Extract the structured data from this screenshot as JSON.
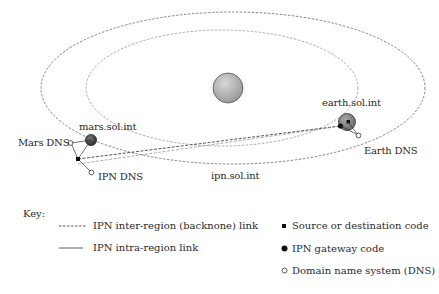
{
  "diagram": {
    "labels": {
      "mars_node": "mars.sol.int",
      "earth_node": "earth.sol.int",
      "mars_dns": "Mars DNS",
      "ipn_dns": "IPN DNS",
      "earth_dns": "Earth DNS",
      "ipn_region": "ipn.sol.int"
    },
    "colors": {
      "orbit_line": "#6a6a6a",
      "sun_fill": "#b5b5b5",
      "planet_fill": "#8a8a8a",
      "node_fill": "#111111",
      "dns_fill": "#ffffff"
    }
  },
  "key": {
    "title": "Key:",
    "items": [
      {
        "symbol": "dashed-line",
        "label": "IPN inter-region (backnone) link"
      },
      {
        "symbol": "solid-line",
        "label": "IPN intra-region link"
      },
      {
        "symbol": "small-black-square",
        "label": "Source or destination code"
      },
      {
        "symbol": "black-circle",
        "label": "IPN gateway code"
      },
      {
        "symbol": "open-circle",
        "label": "Domain name system (DNS)"
      }
    ]
  }
}
